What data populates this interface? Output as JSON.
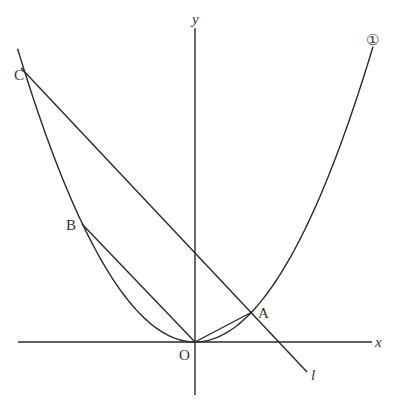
{
  "figure": {
    "type": "coordinate-plane",
    "axes": {
      "x_label": "x",
      "y_label": "y",
      "origin_label": "O"
    },
    "curve": {
      "label": "①",
      "equation_inferred": "y = 1/2 x^2"
    },
    "line": {
      "label": "l"
    },
    "points": [
      {
        "name": "A",
        "label": "A"
      },
      {
        "name": "B",
        "label": "B"
      },
      {
        "name": "C",
        "label": "C"
      },
      {
        "name": "O",
        "label": "O"
      }
    ],
    "segments": [
      "OA",
      "OB",
      "AC (on l)"
    ]
  },
  "render": {
    "origin_px": [
      195,
      342
    ],
    "unit_x_px": 56.5,
    "unit_y_px": 59.5,
    "parabola_coef": 0.5,
    "parabola_x_range": [
      -3.14,
      3.15
    ],
    "line_l": {
      "from": [
        -3.1,
        null
      ],
      "to": [
        2.0,
        null
      ],
      "slope": -1,
      "intercept": 1
    },
    "point_coords": {
      "A": [
        1,
        0.5
      ],
      "B": [
        -2,
        2
      ],
      "C": [
        -3,
        4.5
      ],
      "O": [
        0,
        0
      ]
    }
  }
}
